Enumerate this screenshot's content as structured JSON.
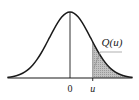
{
  "figure": {
    "background_color": "#ffffff",
    "curve_color": "#1a1a1a",
    "axis_color": "#1a1a1a",
    "shading_color": "#b3b3b3",
    "leader_line_color": "#8c8c8c",
    "text_color": "#1a1a1a"
  },
  "labels": {
    "origin_tick": "0",
    "threshold_tick": "u",
    "tail_area": "Q(u)"
  },
  "chart_data": {
    "type": "area",
    "xlabel": "",
    "ylabel": "",
    "grid": false,
    "legend": "none",
    "annotations": [
      {
        "name": "tail-area-label",
        "text": "Q(u)",
        "x": 2.05,
        "y": 0.52
      },
      {
        "name": "origin-tick-label",
        "text": "0",
        "x": 0,
        "y": -0.08
      },
      {
        "name": "threshold-tick-label",
        "text": "u",
        "x": 1.1,
        "y": -0.08
      }
    ],
    "xlim": [
      -3.0,
      3.0
    ],
    "ylim": [
      0,
      1.1
    ],
    "x": [
      -3.0,
      -2.8,
      -2.6,
      -2.4,
      -2.2,
      -2.0,
      -1.8,
      -1.6,
      -1.4,
      -1.2,
      -1.0,
      -0.8,
      -0.6,
      -0.4,
      -0.2,
      0.0,
      0.2,
      0.4,
      0.6,
      0.8,
      1.0,
      1.2,
      1.4,
      1.6,
      1.8,
      2.0,
      2.2,
      2.4,
      2.6,
      2.8,
      3.0
    ],
    "series": [
      {
        "name": "standard normal pdf",
        "values": [
          0.011,
          0.02,
          0.034,
          0.056,
          0.089,
          0.135,
          0.198,
          0.278,
          0.375,
          0.487,
          0.607,
          0.726,
          0.835,
          0.923,
          0.98,
          1.0,
          0.98,
          0.923,
          0.835,
          0.726,
          0.607,
          0.487,
          0.375,
          0.278,
          0.198,
          0.135,
          0.089,
          0.056,
          0.034,
          0.02,
          0.011
        ]
      }
    ],
    "shaded_region": {
      "name": "right-tail-area",
      "label": "Q(u)",
      "from_x": 1.1,
      "to_x": 3.0,
      "fill": "#b3b3b3"
    },
    "vertical_lines": [
      {
        "name": "center-axis",
        "x": 0.0,
        "from_y": 0.0,
        "to_y": 1.0
      },
      {
        "name": "threshold-boundary",
        "x": 1.1,
        "from_y": 0.0,
        "to_y": 0.546
      }
    ]
  }
}
